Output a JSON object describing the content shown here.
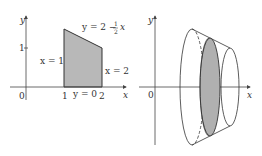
{
  "left_plot": {
    "axis_x_label": "x",
    "axis_y_label": "y",
    "origin_label": "0",
    "tick_x_1": "1",
    "tick_x_2": "2",
    "tick_y_1": "1",
    "curve_top_label_prefix": "y = 2 − ",
    "curve_top_frac_num": "1",
    "curve_top_frac_den": "2",
    "curve_top_label_suffix": "x",
    "left_boundary_label": "x = 1",
    "right_boundary_label": "x = 2",
    "bottom_boundary_label": "y = 0",
    "fill_color": "#b8b8b8"
  },
  "right_plot": {
    "axis_x_label": "x",
    "axis_y_label": "y",
    "origin_label": "0",
    "disk_fill_color": "#b0b0b0"
  }
}
